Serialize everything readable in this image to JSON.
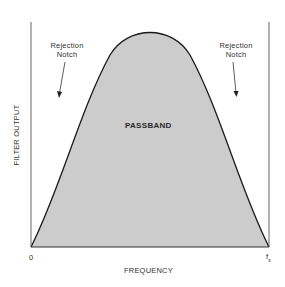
{
  "diagram": {
    "passband_label": "PASSBAND",
    "left_notch": {
      "line1": "Rejection",
      "line2": "Notch"
    },
    "right_notch": {
      "line1": "Rejection",
      "line2": "Notch"
    },
    "y_axis_label": "FILTER OUTPUT",
    "x_axis_label": "FREQUENCY",
    "x_start_tick": "0",
    "x_end_tick": "f",
    "x_end_tick_sub": "s",
    "colors": {
      "fill": "#cccccc",
      "curve": "#1a1a1a",
      "axis": "#555555",
      "background": "#ffffff"
    }
  }
}
